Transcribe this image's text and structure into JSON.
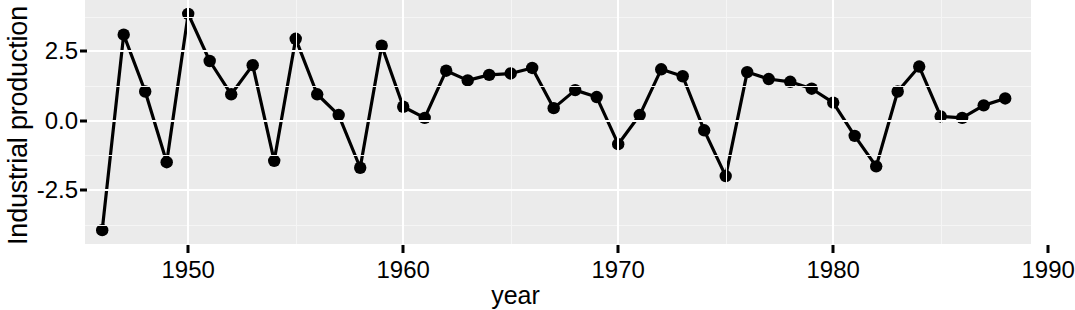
{
  "chart_data": {
    "type": "line",
    "title": "",
    "xlabel": "year",
    "ylabel": "Industrial production",
    "xlim": [
      1945.2,
      1989.2
    ],
    "ylim": [
      -4.45,
      4.35
    ],
    "xticks": [
      1950,
      1960,
      1970,
      1980,
      1990
    ],
    "xticklabels": [
      "1950",
      "1960",
      "1970",
      "1980",
      "1990"
    ],
    "yticks": [
      -2.5,
      0.0,
      2.5
    ],
    "yticklabels": [
      "-2.5",
      "0.0",
      "2.5"
    ],
    "grid": true,
    "legend": null,
    "marker": "circle",
    "line_color": "#000000",
    "point_color": "#000000",
    "panel_background": "#ebebeb",
    "grid_color": "#ffffff",
    "x": [
      1946,
      1947,
      1948,
      1949,
      1950,
      1951,
      1952,
      1953,
      1954,
      1955,
      1956,
      1957,
      1958,
      1959,
      1960,
      1961,
      1962,
      1963,
      1964,
      1965,
      1966,
      1967,
      1968,
      1969,
      1970,
      1971,
      1972,
      1973,
      1974,
      1975,
      1976,
      1977,
      1978,
      1979,
      1980,
      1981,
      1982,
      1983,
      1984,
      1985,
      1986,
      1987,
      1988
    ],
    "y": [
      -3.95,
      3.1,
      1.05,
      -1.5,
      3.85,
      2.15,
      0.95,
      2.0,
      -1.45,
      2.95,
      0.95,
      0.2,
      -1.7,
      2.7,
      0.5,
      0.1,
      1.8,
      1.45,
      1.65,
      1.7,
      1.9,
      0.45,
      1.1,
      0.85,
      -0.85,
      0.2,
      1.85,
      1.6,
      -0.35,
      -2.0,
      1.75,
      1.5,
      1.4,
      1.15,
      0.65,
      -0.55,
      -1.65,
      1.05,
      1.95,
      0.15,
      0.1,
      0.55,
      0.8
    ]
  },
  "axes": {
    "y_title": "Industrial production",
    "x_title": "year"
  }
}
